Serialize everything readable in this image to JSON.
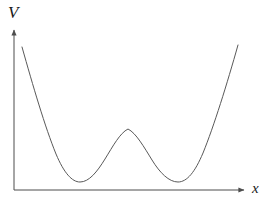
{
  "figure": {
    "kind": "double-well-potential-plot",
    "background_color": "#ffffff",
    "curve_color": "#595959",
    "axis_color": "#4d4d4d",
    "curve_stroke_width": 1,
    "axis_stroke_width": 1
  },
  "axes": {
    "y_axis": {
      "label": "V",
      "icon": "arrow-up-icon",
      "x_px": 14,
      "top_px": 27,
      "bottom_px": 190
    },
    "x_axis": {
      "label": "x",
      "icon": "arrow-right-icon",
      "y_px": 190,
      "left_px": 14,
      "right_px": 248
    }
  },
  "chart_data": {
    "type": "line",
    "title": "",
    "xlabel": "x",
    "ylabel": "V",
    "grid": false,
    "legend": null,
    "axis_ticks": {
      "x": [],
      "y": []
    },
    "xlim": [
      22,
      238
    ],
    "ylim": [
      190,
      45
    ],
    "series": [
      {
        "name": "V(x)",
        "description": "symmetric double-well potential with two minima and a central local maximum",
        "features": {
          "left_minimum": {
            "x": 80,
            "y": 182
          },
          "right_minimum": {
            "x": 178,
            "y": 182
          },
          "central_maximum": {
            "x": 128,
            "y": 129
          },
          "left_branch_top": {
            "x": 22,
            "y": 47
          },
          "right_branch_top": {
            "x": 238,
            "y": 45
          }
        },
        "path": "M 22,47 C 33,86 45,127 56,154 C 64,173 72,182 80,182 C 89,182 97,172 105,159 C 113,146 120,133 128,129 C 136,133 144,147 152,160 C 160,173 169,182 178,182 C 187,182 195,172 203,153 C 214,126 227,84 238,45"
      }
    ]
  }
}
